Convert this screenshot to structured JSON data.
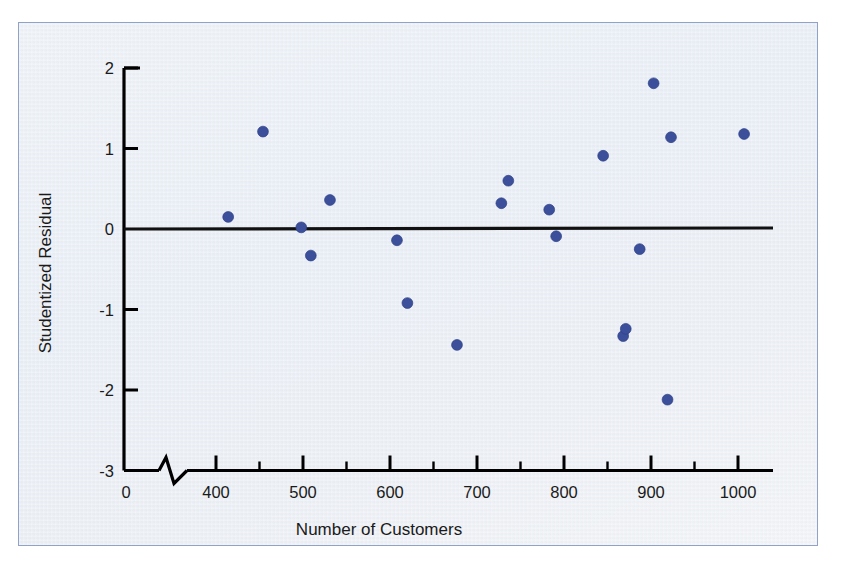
{
  "figure": {
    "background_color": "#ecf0f6",
    "border_color": "#8fa3c8",
    "point_color": "#3b4f9b",
    "axis_color": "#000000"
  },
  "chart_data": {
    "type": "scatter",
    "title": "",
    "subtitle": "",
    "xlabel": "Number of Customers",
    "ylabel": "Studentized Residual",
    "xlim": [
      0,
      1050
    ],
    "ylim": [
      -3,
      2
    ],
    "grid": false,
    "legend": null,
    "axis_break": {
      "present": true,
      "axis": "x",
      "between": [
        0,
        400
      ],
      "symbol": "zigzag"
    },
    "reference_line": {
      "orientation": "horizontal",
      "value": 0,
      "color": "#111111"
    },
    "xticks_major": [
      0,
      400,
      500,
      600,
      700,
      800,
      900,
      1000
    ],
    "xtick_labels": [
      "0",
      "400",
      "500",
      "600",
      "700",
      "800",
      "900",
      "1000"
    ],
    "xticks_minor": [
      450,
      550,
      650,
      750,
      850,
      950
    ],
    "yticks": [
      2,
      1,
      0,
      -1,
      -2,
      -3
    ],
    "ytick_labels": [
      "2",
      "1",
      "0",
      "-1",
      "-2",
      "-3"
    ],
    "n_points": 20,
    "points": [
      {
        "x": 414,
        "y": 0.15
      },
      {
        "x": 454,
        "y": 1.21
      },
      {
        "x": 498,
        "y": 0.02
      },
      {
        "x": 509,
        "y": -0.33
      },
      {
        "x": 531,
        "y": 0.36
      },
      {
        "x": 608,
        "y": -0.14
      },
      {
        "x": 620,
        "y": -0.92
      },
      {
        "x": 677,
        "y": -1.44
      },
      {
        "x": 728,
        "y": 0.32
      },
      {
        "x": 736,
        "y": 0.6
      },
      {
        "x": 783,
        "y": 0.24
      },
      {
        "x": 791,
        "y": -0.09
      },
      {
        "x": 845,
        "y": 0.91
      },
      {
        "x": 868,
        "y": -1.33
      },
      {
        "x": 871,
        "y": -1.24
      },
      {
        "x": 887,
        "y": -0.25
      },
      {
        "x": 903,
        "y": 1.81
      },
      {
        "x": 919,
        "y": -2.12
      },
      {
        "x": 923,
        "y": 1.14
      },
      {
        "x": 1007,
        "y": 1.18
      }
    ]
  }
}
